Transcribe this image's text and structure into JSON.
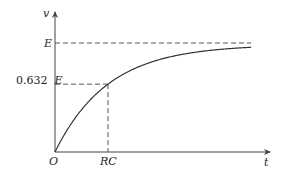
{
  "chart_data": {
    "type": "line",
    "title": "",
    "xlabel": "t",
    "ylabel": "v",
    "origin_label": "O",
    "xtick_labels": [
      "RC"
    ],
    "ytick_labels": [
      "E",
      "0.632 E"
    ],
    "ytick_prefix": "0.632",
    "ytick_suffix": "E",
    "function": "v = E(1 - e^(-t/RC))",
    "time_constant_fraction": 0.632,
    "asymptote": "E",
    "x_range_in_RC": [
      0,
      3.7
    ],
    "y_range_in_E": [
      0,
      1.15
    ],
    "grid": false,
    "guides": [
      {
        "type": "horizontal-dashed",
        "value_in_E": 1.0,
        "label": "E"
      },
      {
        "type": "horizontal-dashed",
        "value_in_E": 0.632,
        "label": "0.632 E"
      },
      {
        "type": "vertical-dashed",
        "value_in_RC": 1.0,
        "label": "RC"
      }
    ],
    "colors": {
      "curve": "#333333",
      "axis": "#444444",
      "guide": "#555555"
    }
  }
}
